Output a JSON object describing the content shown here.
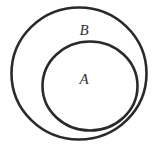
{
  "diagram": {
    "type": "venn-subset",
    "sets": [
      {
        "label": "B",
        "role": "outer"
      },
      {
        "label": "A",
        "role": "inner"
      }
    ],
    "stroke_color": "#2a2a2a",
    "background": "#ffffff"
  }
}
